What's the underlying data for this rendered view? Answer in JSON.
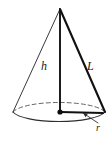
{
  "figure": {
    "kind": "geometry-diagram",
    "shape": "right-circular-cone",
    "title": "",
    "background_color": "#ffffff",
    "labels": {
      "height": "h",
      "slant_height": "L",
      "radius": "r"
    },
    "colors": {
      "outline_light": "#3a3a3a",
      "outline_bold": "#111111",
      "hidden_edge": "#555555",
      "label_text": "#1a1a1a"
    },
    "geometry": {
      "apex": [
        60,
        9
      ],
      "base_center": [
        60,
        112
      ],
      "base_rx": 47,
      "base_ry": 12,
      "left_base_point": [
        13,
        112
      ],
      "right_base_point": [
        105,
        112
      ],
      "radius_endpoint": [
        103,
        113
      ],
      "leader_from": [
        99,
        122
      ],
      "leader_to": [
        82,
        113
      ]
    },
    "elements": [
      "apex-vertex",
      "left-slant-edge",
      "right-slant-edge-bold",
      "vertical-height-axis",
      "base-ellipse-front-arc",
      "base-ellipse-back-arc-dashed",
      "radius-segment",
      "center-dot",
      "radius-leader-arrow"
    ]
  }
}
